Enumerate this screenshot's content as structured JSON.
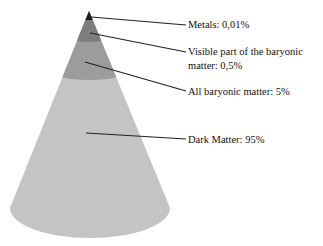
{
  "diagram": {
    "type": "cone-composition",
    "layers": [
      {
        "name": "Metals",
        "value": "0,01%",
        "label": "Metals: 0,01%",
        "color": "#1a1a1a"
      },
      {
        "name": "Visible part of the baryonic matter",
        "value": "0,5%",
        "label_line1": "Visible part of the baryonic",
        "label_line2": "matter: 0,5%",
        "color": "#7d7d7d"
      },
      {
        "name": "All baryonic matter",
        "value": "5%",
        "label": "All baryonic matter: 5%",
        "color": "#9c9c9c"
      },
      {
        "name": "Dark Matter",
        "value": "95%",
        "label": "Dark Matter: 95%",
        "color": "#c4c4c4"
      }
    ]
  }
}
